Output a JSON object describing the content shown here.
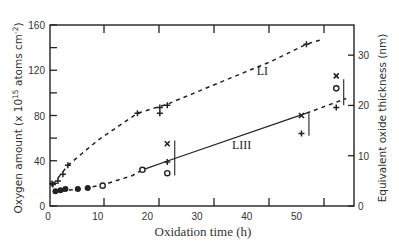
{
  "chart_data": {
    "type": "scatter",
    "title": "",
    "xlabel": "Oxidation time (h)",
    "ylabel": "Oxygen amount (x 10^15 atoms cm^-2)",
    "ylabel_parts": {
      "main": "Oxygen amount (x 10",
      "sup1": "15",
      "mid": " atoms cm",
      "sup2": "-2",
      "end": ")"
    },
    "y2label": "Equivalent oxide thickness (nm)",
    "xlim": [
      0,
      61
    ],
    "ylim": [
      0,
      160
    ],
    "y2lim": [
      0,
      36
    ],
    "x_ticks": [
      0,
      10,
      20,
      30,
      40,
      50
    ],
    "y_ticks": [
      0,
      40,
      80,
      120,
      160
    ],
    "y2_ticks": [
      0,
      10,
      20,
      30
    ],
    "grid": false,
    "legend": "none (inline labels)",
    "series": [
      {
        "name": "LI",
        "style": "dashed",
        "marker": "+",
        "label_pos": {
          "x": 42,
          "y": 116
        },
        "points": [
          {
            "x": 1,
            "y": 19
          },
          {
            "x": 2,
            "y": 22
          },
          {
            "x": 3,
            "y": 28
          },
          {
            "x": 4,
            "y": 36
          },
          {
            "x": 18,
            "y": 82
          },
          {
            "x": 22.5,
            "y": 87
          },
          {
            "x": 22.5,
            "y": 82
          },
          {
            "x": 24,
            "y": 89
          },
          {
            "x": 52,
            "y": 143
          }
        ],
        "curve": [
          {
            "x": 1,
            "y": 19
          },
          {
            "x": 4,
            "y": 36
          },
          {
            "x": 10,
            "y": 58
          },
          {
            "x": 18,
            "y": 82
          },
          {
            "x": 24,
            "y": 90
          },
          {
            "x": 35,
            "y": 110
          },
          {
            "x": 45,
            "y": 128
          },
          {
            "x": 52,
            "y": 143
          },
          {
            "x": 55,
            "y": 147
          }
        ]
      },
      {
        "name": "LIII",
        "style": "dashed then solid",
        "marker": "o / • / x / +",
        "label_pos": {
          "x": 37,
          "y": 50
        },
        "points_filled": [
          {
            "x": 1.5,
            "y": 13
          },
          {
            "x": 2.5,
            "y": 14
          },
          {
            "x": 3.5,
            "y": 15
          },
          {
            "x": 6,
            "y": 15
          },
          {
            "x": 8,
            "y": 16
          }
        ],
        "points_open": [
          {
            "x": 11,
            "y": 18
          },
          {
            "x": 19,
            "y": 32
          },
          {
            "x": 24,
            "y": 29
          },
          {
            "x": 58,
            "y": 104
          }
        ],
        "points_x": [
          {
            "x": 24,
            "y": 55
          },
          {
            "x": 51,
            "y": 80
          },
          {
            "x": 58,
            "y": 115
          }
        ],
        "points_plus": [
          {
            "x": 24,
            "y": 39
          },
          {
            "x": 51,
            "y": 64
          },
          {
            "x": 58,
            "y": 87
          },
          {
            "x": 0.8,
            "y": 20
          }
        ],
        "dashed_curve": [
          {
            "x": 1,
            "y": 12
          },
          {
            "x": 4,
            "y": 14
          },
          {
            "x": 8,
            "y": 16
          },
          {
            "x": 12,
            "y": 20
          },
          {
            "x": 17,
            "y": 27
          },
          {
            "x": 19,
            "y": 32
          }
        ],
        "solid_line": [
          {
            "x": 19,
            "y": 32
          },
          {
            "x": 25.5,
            "y": 42
          },
          {
            "x": 52,
            "y": 82
          }
        ],
        "dashed_tail": [
          {
            "x": 52,
            "y": 82
          },
          {
            "x": 60,
            "y": 95
          }
        ],
        "error_bars": [
          {
            "x": 25.5,
            "y_low": 27,
            "y_high": 58
          },
          {
            "x": 52.5,
            "y_low": 62,
            "y_high": 82
          },
          {
            "x": 59.5,
            "y_low": 89,
            "y_high": 112
          }
        ]
      }
    ]
  }
}
